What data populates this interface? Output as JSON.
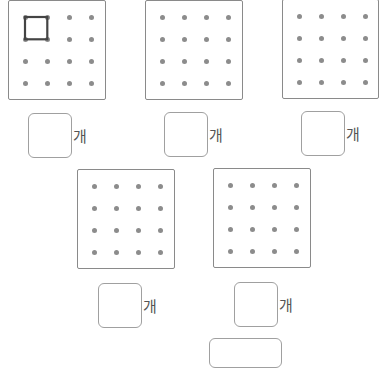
{
  "unit_label": "개",
  "grid": {
    "rows": 4,
    "cols": 4
  },
  "boards": [
    {
      "id": 1,
      "shapes": [
        {
          "type": "square",
          "from": [
            0,
            0
          ],
          "to": [
            1,
            1
          ]
        }
      ]
    },
    {
      "id": 2,
      "shapes": []
    },
    {
      "id": 3,
      "shapes": []
    },
    {
      "id": 4,
      "shapes": []
    },
    {
      "id": 5,
      "shapes": []
    }
  ],
  "answers": [
    "",
    "",
    "",
    "",
    ""
  ],
  "colors": {
    "dot": "#8c8c8c",
    "shape": "#444444",
    "border": "#8a8a8a"
  }
}
